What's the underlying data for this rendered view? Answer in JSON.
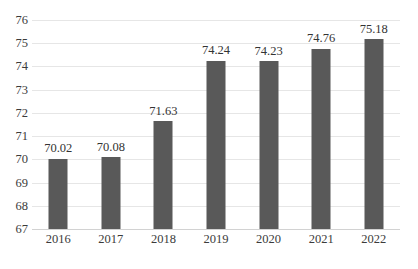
{
  "chart_data": {
    "type": "bar",
    "title": "",
    "subtitle": "",
    "xlabel": "",
    "ylabel": "",
    "categories": [
      "2016",
      "2017",
      "2018",
      "2019",
      "2020",
      "2021",
      "2022"
    ],
    "values": [
      70.02,
      70.08,
      71.63,
      74.24,
      74.23,
      74.76,
      75.18
    ],
    "data_labels": [
      "70.02",
      "70.08",
      "71.63",
      "74.24",
      "74.23",
      "74.76",
      "75.18"
    ],
    "ylim": [
      67,
      76
    ],
    "y_ticks": [
      76,
      75,
      74,
      73,
      72,
      71,
      70,
      69,
      68,
      67
    ],
    "y_tick_labels": [
      "76",
      "75",
      "74",
      "73",
      "72",
      "71",
      "70",
      "69",
      "68",
      "67"
    ],
    "grid": true,
    "legend": "none",
    "series": [
      {
        "name": "",
        "values": [
          70.02,
          70.08,
          71.63,
          74.24,
          74.23,
          74.76,
          75.18
        ]
      }
    ]
  },
  "style": {
    "bar_color": "#595959",
    "gridline_color": "#e6e6e6",
    "baseline_color": "#d2d2d2",
    "tick_label_color": "#3b3b3b",
    "data_label_color": "#333333",
    "background": "#ffffff"
  }
}
